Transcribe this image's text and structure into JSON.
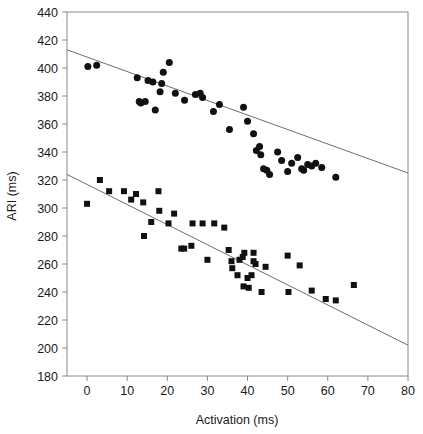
{
  "chart_data": {
    "type": "scatter",
    "title": "",
    "xlabel": "Activation (ms)",
    "ylabel": "ARI (ms)",
    "xlim": [
      -5,
      80
    ],
    "ylim": [
      180,
      440
    ],
    "xticks": [
      0,
      10,
      20,
      30,
      40,
      50,
      60,
      70,
      80
    ],
    "yticks": [
      180,
      200,
      220,
      240,
      260,
      280,
      300,
      320,
      340,
      360,
      380,
      400,
      420,
      440
    ],
    "xtick_labels": [
      "0",
      "10",
      "20",
      "30",
      "40",
      "50",
      "60",
      "70",
      "80"
    ],
    "ytick_labels": [
      "180",
      "200",
      "220",
      "240",
      "260",
      "280",
      "300",
      "320",
      "340",
      "360",
      "380",
      "400",
      "420",
      "440"
    ],
    "grid": false,
    "legend": "none",
    "marker_color": "#111111",
    "fit_line_color": "#6e6e6e",
    "axis_color": "#8a8a8a",
    "series": [
      {
        "name": "circles",
        "marker": "circle",
        "marker_size": 7,
        "points": [
          [
            0.2,
            401
          ],
          [
            2.4,
            402
          ],
          [
            12.5,
            393
          ],
          [
            13.0,
            376
          ],
          [
            13.4,
            375
          ],
          [
            14.5,
            376
          ],
          [
            15.2,
            391
          ],
          [
            16.4,
            390
          ],
          [
            17.0,
            370
          ],
          [
            18.2,
            383
          ],
          [
            18.6,
            389
          ],
          [
            19.0,
            397
          ],
          [
            20.5,
            404
          ],
          [
            22.0,
            382
          ],
          [
            24.3,
            377
          ],
          [
            27.0,
            381
          ],
          [
            28.2,
            382
          ],
          [
            28.8,
            379
          ],
          [
            31.5,
            369
          ],
          [
            33.0,
            374
          ],
          [
            35.5,
            356
          ],
          [
            39.0,
            372
          ],
          [
            40.0,
            362
          ],
          [
            41.5,
            353
          ],
          [
            42.2,
            341
          ],
          [
            43.0,
            344
          ],
          [
            43.3,
            338
          ],
          [
            44.0,
            328
          ],
          [
            44.8,
            327
          ],
          [
            45.5,
            324
          ],
          [
            47.5,
            340
          ],
          [
            48.5,
            334
          ],
          [
            50.0,
            326
          ],
          [
            51.0,
            332
          ],
          [
            52.5,
            336
          ],
          [
            53.5,
            328
          ],
          [
            54.0,
            327
          ],
          [
            55.0,
            331
          ],
          [
            56.0,
            330
          ],
          [
            57.0,
            332
          ],
          [
            58.5,
            329
          ],
          [
            62.0,
            322
          ]
        ]
      },
      {
        "name": "squares",
        "marker": "square",
        "marker_size": 6,
        "points": [
          [
            0.0,
            303
          ],
          [
            3.2,
            320
          ],
          [
            5.5,
            312
          ],
          [
            9.2,
            312
          ],
          [
            11.0,
            306
          ],
          [
            12.2,
            310
          ],
          [
            14.0,
            304
          ],
          [
            14.2,
            280
          ],
          [
            16.0,
            290
          ],
          [
            17.8,
            312
          ],
          [
            18.0,
            298
          ],
          [
            20.3,
            289
          ],
          [
            21.7,
            296
          ],
          [
            23.5,
            271
          ],
          [
            24.2,
            271
          ],
          [
            26.0,
            273
          ],
          [
            26.3,
            289
          ],
          [
            28.8,
            289
          ],
          [
            30.0,
            263
          ],
          [
            31.7,
            289
          ],
          [
            34.2,
            286
          ],
          [
            35.3,
            270
          ],
          [
            36.0,
            262
          ],
          [
            36.2,
            257
          ],
          [
            37.5,
            252
          ],
          [
            38.0,
            263
          ],
          [
            38.8,
            265
          ],
          [
            39.0,
            244
          ],
          [
            39.2,
            268
          ],
          [
            40.0,
            250
          ],
          [
            40.3,
            243
          ],
          [
            41.0,
            252
          ],
          [
            41.5,
            268
          ],
          [
            41.5,
            262
          ],
          [
            42.0,
            260
          ],
          [
            43.5,
            240
          ],
          [
            44.5,
            258
          ],
          [
            50.0,
            266
          ],
          [
            50.2,
            240
          ],
          [
            53.0,
            259
          ],
          [
            56.0,
            241
          ],
          [
            59.5,
            235
          ],
          [
            62.0,
            234
          ],
          [
            66.5,
            245
          ]
        ]
      }
    ],
    "fit_lines": [
      {
        "name": "circles-fit",
        "x_start": -5,
        "y_start": 413,
        "x_end": 80,
        "y_end": 325
      },
      {
        "name": "squares-fit",
        "x_start": -5,
        "y_start": 324,
        "x_end": 80,
        "y_end": 202
      }
    ]
  }
}
